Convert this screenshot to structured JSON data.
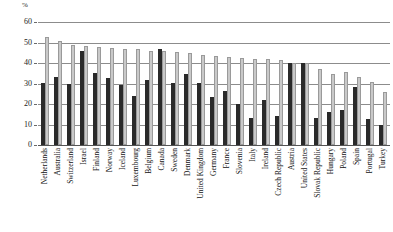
{
  "chart_data": {
    "type": "bar",
    "title": "",
    "xlabel": "",
    "ylabel": "%",
    "unit_label": "%",
    "ylim": [
      0,
      60
    ],
    "yticks": [
      0,
      10,
      20,
      30,
      40,
      50,
      60
    ],
    "grid": true,
    "legend_position": "none",
    "categories": [
      "Netherlands",
      "Australia",
      "Switzerland",
      "Israel",
      "Finland",
      "Norway",
      "Iceland",
      "Luxembourg",
      "Belgium",
      "Canada",
      "Sweden",
      "Denmark",
      "United Kingdom",
      "Germany",
      "France",
      "Slovenia",
      "Italy",
      "Ireland",
      "Czech Republic",
      "Austria",
      "United States",
      "Slovak Republic",
      "Hungary",
      "Poland",
      "Spain",
      "Portugal",
      "Turkey"
    ],
    "series": [
      {
        "name": "dark",
        "values": [
          30.2,
          33.0,
          30.0,
          45.8,
          35.0,
          32.8,
          29.4,
          23.8,
          31.6,
          46.8,
          30.4,
          34.5,
          30.2,
          23.6,
          26.2,
          19.8,
          13.2,
          22.0,
          14.0,
          39.8,
          40.0,
          13.2,
          16.0,
          17.0,
          28.4,
          12.6,
          10.0
        ]
      },
      {
        "name": "light",
        "values": [
          52.8,
          50.5,
          48.8,
          48.2,
          47.8,
          47.5,
          46.8,
          46.6,
          45.8,
          45.9,
          45.4,
          44.8,
          43.8,
          43.2,
          42.8,
          42.5,
          42.0,
          41.8,
          41.4,
          40.0,
          39.8,
          37.0,
          34.6,
          35.8,
          33.0,
          30.6,
          26.0
        ]
      }
    ]
  }
}
